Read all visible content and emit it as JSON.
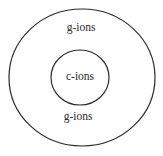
{
  "diagram": {
    "type": "nested-circles",
    "outer_region": {
      "top_label": "g-ions",
      "bottom_label": "g-ions"
    },
    "inner_region": {
      "label": "c-ions"
    },
    "colors": {
      "stroke": "#2a2a2a",
      "background": "#ffffff"
    }
  }
}
